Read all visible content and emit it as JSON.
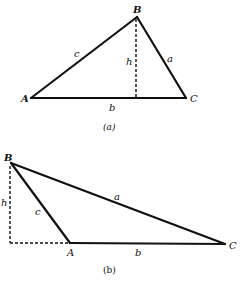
{
  "diagrams": [
    {
      "id": "a",
      "caption": "(a)",
      "caption_letter": "a",
      "vertices": {
        "A": {
          "label": "A",
          "x": 31,
          "y": 98
        },
        "B": {
          "label": "B",
          "x": 137,
          "y": 17
        },
        "C": {
          "label": "C",
          "x": 186,
          "y": 98
        }
      },
      "sides": {
        "a": {
          "label": "a",
          "from": "B",
          "to": "C"
        },
        "b": {
          "label": "b",
          "from": "A",
          "to": "C"
        },
        "c": {
          "label": "c",
          "from": "A",
          "to": "B"
        }
      },
      "height": {
        "label": "h",
        "from": [
          136,
          17
        ],
        "to": [
          136,
          98
        ],
        "style": "dashed"
      }
    },
    {
      "id": "b",
      "caption": "(b)",
      "caption_letter": "b",
      "vertices": {
        "A": {
          "label": "A",
          "x": 70,
          "y": 243
        },
        "B": {
          "label": "B",
          "x": 11,
          "y": 163
        },
        "C": {
          "label": "C",
          "x": 225,
          "y": 244
        }
      },
      "sides": {
        "a": {
          "label": "a",
          "from": "B",
          "to": "C"
        },
        "b": {
          "label": "b",
          "from": "A",
          "to": "C"
        },
        "c": {
          "label": "c",
          "from": "A",
          "to": "B"
        }
      },
      "height": {
        "label": "h",
        "from": [
          10,
          163
        ],
        "to": [
          10,
          243
        ],
        "style": "dashed"
      },
      "extension": {
        "from": [
          10,
          243
        ],
        "to": [
          70,
          243
        ],
        "style": "dashed"
      }
    }
  ],
  "labels": {
    "a_B": "B",
    "a_A": "A",
    "a_C": "C",
    "a_side_a": "a",
    "a_side_b": "b",
    "a_side_c": "c",
    "a_h": "h",
    "a_caption": "(a)",
    "b_B": "B",
    "b_A": "A",
    "b_C": "C",
    "b_side_a": "a",
    "b_side_b": "b",
    "b_side_c": "c",
    "b_h": "h",
    "b_caption": "(b)"
  }
}
